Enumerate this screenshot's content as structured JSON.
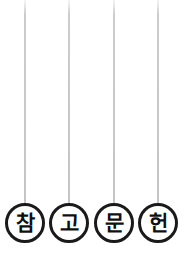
{
  "canvas": {
    "width": 185,
    "height": 254,
    "background_color": "#ffffff"
  },
  "style": {
    "string_color": "#8a8a8a",
    "circle_stroke_color": "#1a1a1a",
    "circle_fill_color": "#ffffff",
    "character_color": "#101010"
  },
  "graphic": {
    "kind": "hanging-circular-badges",
    "phrase": "참고문헌",
    "badges": [
      {
        "char": "참",
        "center_x": 25,
        "center_y": 223,
        "diameter": 40,
        "string_top_y": 0,
        "string_bottom_y": 203
      },
      {
        "char": "고",
        "center_x": 69,
        "center_y": 223,
        "diameter": 40,
        "string_top_y": 0,
        "string_bottom_y": 203
      },
      {
        "char": "문",
        "center_x": 114,
        "center_y": 223,
        "diameter": 40,
        "string_top_y": 0,
        "string_bottom_y": 203
      },
      {
        "char": "헌",
        "center_x": 158,
        "center_y": 223,
        "diameter": 40,
        "string_top_y": 0,
        "string_bottom_y": 203
      }
    ]
  }
}
